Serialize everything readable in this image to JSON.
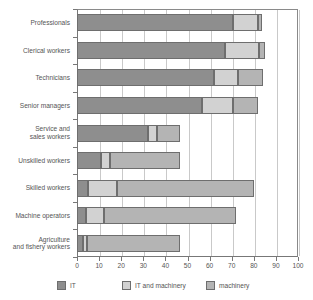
{
  "chart_data": {
    "type": "bar",
    "orientation": "horizontal",
    "stacked": true,
    "title": "",
    "subtitle": "",
    "xlabel": "",
    "ylabel": "",
    "xlim": [
      0,
      100
    ],
    "xticks": [
      0,
      10,
      20,
      30,
      40,
      50,
      60,
      70,
      80,
      90,
      100
    ],
    "xtick_labels": [
      "0",
      "10",
      "20",
      "30",
      "40",
      "50",
      "60",
      "70",
      "80",
      "90",
      "100"
    ],
    "grid": true,
    "grid_axis": "x",
    "legend_position": "bottom",
    "categories": [
      "Professionals",
      "Clerical workers",
      "Technicians",
      "Senior managers",
      "Service and sales workers",
      "Unskilled workers",
      "Skilled workers",
      "Machine operators",
      "Agriculture and fishery workers"
    ],
    "category_lines": [
      [
        "Professionals"
      ],
      [
        "Clerical workers"
      ],
      [
        "Technicians"
      ],
      [
        "Senior managers"
      ],
      [
        "Service and",
        "sales workers"
      ],
      [
        "Unskilled workers"
      ],
      [
        "Skilled workers"
      ],
      [
        "Machine operators"
      ],
      [
        "Agriculture",
        "and fishery workers"
      ]
    ],
    "series": [
      {
        "name": "IT",
        "color": "#8e8e8e",
        "values": [
          70.5,
          67.0,
          62.0,
          56.5,
          32.0,
          11.0,
          5.0,
          4.0,
          2.5
        ]
      },
      {
        "name": "IT and machinery",
        "color": "#d2d2d2",
        "values": [
          11.5,
          15.5,
          11.0,
          14.0,
          4.0,
          4.0,
          13.0,
          8.0,
          2.0
        ]
      },
      {
        "name": "machinery",
        "color": "#b4b4b4",
        "values": [
          1.5,
          2.5,
          11.0,
          11.5,
          10.5,
          31.5,
          62.0,
          60.0,
          42.0
        ]
      }
    ],
    "totals": [
      83.5,
      85.0,
      84.0,
      82.0,
      46.5,
      46.5,
      80.0,
      72.0,
      46.5
    ]
  },
  "legend": {
    "items": [
      {
        "label": "IT",
        "swatch": "s0"
      },
      {
        "label": "IT and machinery",
        "swatch": "s1"
      },
      {
        "label": "machinery",
        "swatch": "s2"
      }
    ]
  }
}
